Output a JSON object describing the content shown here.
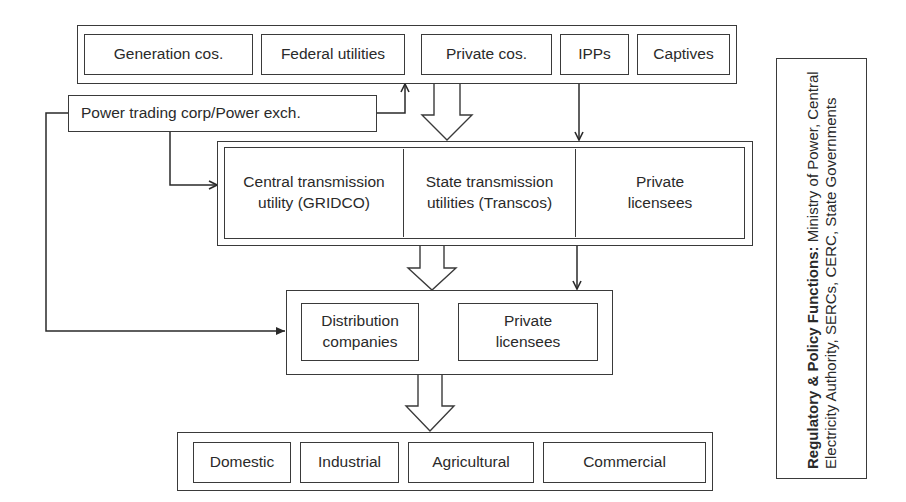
{
  "diagram": {
    "generation_tier": {
      "items": [
        "Generation cos.",
        "Federal utilities",
        "Private cos.",
        "IPPs",
        "Captives"
      ]
    },
    "trading": {
      "label": "Power trading corp/Power exch."
    },
    "transmission_tier": {
      "items": [
        {
          "line1": "Central transmission",
          "line2": "utility (GRIDCO)"
        },
        {
          "line1": "State transmission",
          "line2": "utilities (Transcos)"
        },
        {
          "line1": "Private",
          "line2": "licensees"
        }
      ]
    },
    "distribution_tier": {
      "items": [
        {
          "line1": "Distribution",
          "line2": "companies"
        },
        {
          "line1": "Private",
          "line2": "licensees"
        }
      ]
    },
    "consumer_tier": {
      "items": [
        "Domestic",
        "Industrial",
        "Agricultural",
        "Commercial"
      ]
    },
    "regulatory": {
      "title": "Regulatory & Policy Functions:",
      "body": "Ministry of Power, Central Electricity Authority, SERCs, CERC, State Governments"
    },
    "colors": {
      "line": "#3a3a3a",
      "background": "#ffffff"
    }
  }
}
